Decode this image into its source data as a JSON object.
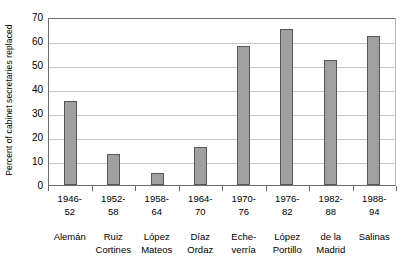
{
  "chart_data": {
    "type": "bar",
    "title": "",
    "xlabel": "",
    "ylabel": "Percent of cabinet secretaries replaced",
    "ylim": [
      0,
      70
    ],
    "ytick_labels": [
      "70",
      "60",
      "50",
      "40",
      "30",
      "20",
      "10",
      "0"
    ],
    "ytick_values": [
      70,
      60,
      50,
      40,
      30,
      20,
      10,
      0
    ],
    "grid": true,
    "legend": "none",
    "categories": [
      "1946-52 Alemán",
      "1952-58 Ruiz Cortines",
      "1958-64 López Mateos",
      "1964-70 Díaz Ordaz",
      "1970-76 Echeverría",
      "1976-82 López Portillo",
      "1982-88 de la Madrid",
      "1988-94 Salinas"
    ],
    "values": [
      35,
      13,
      5,
      16,
      58,
      65,
      52,
      62
    ],
    "periods": [
      {
        "line1": "1946-",
        "line2": "52"
      },
      {
        "line1": "1952-",
        "line2": "58"
      },
      {
        "line1": "1958-",
        "line2": "64"
      },
      {
        "line1": "1964-",
        "line2": "70"
      },
      {
        "line1": "1970-",
        "line2": "76"
      },
      {
        "line1": "1976-",
        "line2": "82"
      },
      {
        "line1": "1982-",
        "line2": "88"
      },
      {
        "line1": "1988-",
        "line2": "94"
      }
    ],
    "names": [
      {
        "line1": "Alemán",
        "line2": ""
      },
      {
        "line1": "Ruiz",
        "line2": "Cortines"
      },
      {
        "line1": "López",
        "line2": "Mateos"
      },
      {
        "line1": "Díaz",
        "line2": "Ordaz"
      },
      {
        "line1": "Eche-",
        "line2": "verría"
      },
      {
        "line1": "López",
        "line2": "Portillo"
      },
      {
        "line1": "de la",
        "line2": "Madrid"
      },
      {
        "line1": "Salinas",
        "line2": ""
      }
    ],
    "colors": {
      "bar_fill": "#a0a0a0",
      "bar_border": "#575757",
      "gridline": "#c8c8c8",
      "axis": "#6d6d6d",
      "background": "#ffffff",
      "text": "#000000"
    }
  }
}
